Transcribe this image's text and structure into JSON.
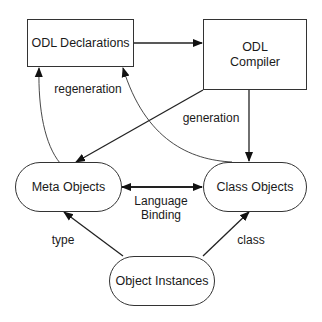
{
  "diagram": {
    "nodes": [
      {
        "id": "odl_declarations",
        "label": "ODL Declarations",
        "shape": "rectangle"
      },
      {
        "id": "odl_compiler",
        "label": "ODL\nCompiler",
        "shape": "rectangle"
      },
      {
        "id": "meta_objects",
        "label": "Meta Objects",
        "shape": "rounded"
      },
      {
        "id": "class_objects",
        "label": "Class Objects",
        "shape": "rounded"
      },
      {
        "id": "object_instances",
        "label": "Object Instances",
        "shape": "rounded"
      }
    ],
    "edges": [
      {
        "from": "odl_declarations",
        "to": "odl_compiler",
        "label": ""
      },
      {
        "from": "odl_compiler",
        "to": "class_objects",
        "label": "generation"
      },
      {
        "from": "odl_compiler",
        "to": "meta_objects",
        "label": "generation"
      },
      {
        "from": "meta_objects",
        "to": "odl_declarations",
        "label": "regeneration"
      },
      {
        "from": "class_objects",
        "to": "odl_declarations",
        "label": "regeneration"
      },
      {
        "from": "meta_objects",
        "to": "class_objects",
        "label": "Language\nBinding",
        "bidirectional": true
      },
      {
        "from": "object_instances",
        "to": "meta_objects",
        "label": "type"
      },
      {
        "from": "object_instances",
        "to": "class_objects",
        "label": "class"
      }
    ],
    "labels": {
      "regeneration": "regeneration",
      "generation": "generation",
      "language_binding": "Language\nBinding",
      "type": "type",
      "class": "class"
    }
  }
}
